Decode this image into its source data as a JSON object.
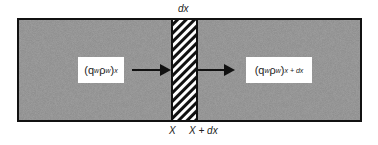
{
  "diagram": {
    "top_label": "dx",
    "left_flux": {
      "base": "(q",
      "w1": "w",
      "rho": "ρ",
      "w2": "w",
      "close": ")",
      "subscript": "x"
    },
    "right_flux": {
      "base": "(q",
      "w1": "w",
      "rho": "ρ",
      "w2": "w",
      "close": ")",
      "subscript": "x + dx"
    },
    "bottom_left_label": "X",
    "bottom_right_label": "X + dx",
    "colors": {
      "medium_fill": "#8a8a8a",
      "border": "#111111",
      "hatch": "#111111",
      "label_bg": "#ffffff"
    }
  }
}
